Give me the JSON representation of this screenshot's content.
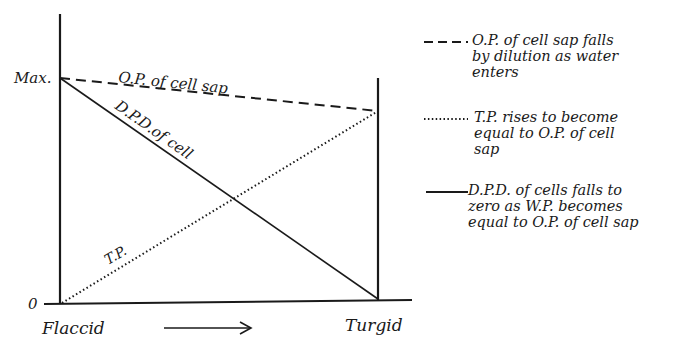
{
  "diagram": {
    "y_axis": {
      "max_label": "Max.",
      "zero_label": "0"
    },
    "x_axis": {
      "start_label": "Flaccid",
      "end_label": "Turgid",
      "arrow": "right-arrow"
    },
    "curve_labels": {
      "op": "O.P. of cell sap",
      "dpd": "D.P.D.of cell",
      "tp": "T.P."
    },
    "lines": [
      {
        "id": "op",
        "style": "dashed",
        "from": [
          "Flaccid",
          "Max"
        ],
        "to": [
          "Turgid",
          "slightly below Max"
        ]
      },
      {
        "id": "dpd",
        "style": "solid",
        "from": [
          "Flaccid",
          "Max"
        ],
        "to": [
          "Turgid",
          "0"
        ]
      },
      {
        "id": "tp",
        "style": "dotted",
        "from": [
          "Flaccid",
          "0"
        ],
        "to": [
          "Turgid",
          "equal to O.P."
        ]
      }
    ]
  },
  "legend": [
    {
      "style": "dashed",
      "sample": "---",
      "lines": [
        "O.P. of cell sap falls",
        "by dilution as water",
        "enters"
      ]
    },
    {
      "style": "dotted",
      "sample": "·········",
      "lines": [
        "T.P. rises to become",
        "equal to O.P. of cell",
        "sap"
      ]
    },
    {
      "style": "solid",
      "sample": "——",
      "lines": [
        "D.P.D. of cells falls to",
        "zero as W.P. becomes",
        "equal to O.P. of cell sap"
      ]
    }
  ]
}
